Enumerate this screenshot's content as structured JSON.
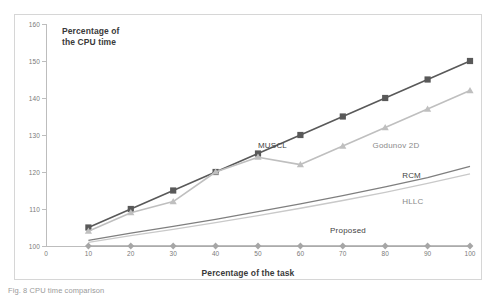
{
  "figure": {
    "caption": "Fig. 8 CPU time comparison"
  },
  "chart_data": {
    "type": "line",
    "title": "",
    "axis_title_y": "Percentage of\nthe CPU time",
    "axis_title_y_line1": "Percentage of",
    "axis_title_y_line2": "the CPU time",
    "xlabel": "Percentage of the task",
    "ylabel": "Percentage of the CPU time",
    "x": [
      10,
      20,
      30,
      40,
      50,
      60,
      70,
      80,
      90,
      100
    ],
    "xticks": [
      0,
      10,
      20,
      30,
      40,
      50,
      60,
      70,
      80,
      90,
      100
    ],
    "yticks": [
      100,
      110,
      120,
      130,
      140,
      150,
      160
    ],
    "y_axis_origin_label": "0",
    "xlim": [
      0,
      100
    ],
    "ylim": [
      100,
      160
    ],
    "grid": false,
    "legend_position": "inline-annotations",
    "series": [
      {
        "name": "MUSCL",
        "color": "#595959",
        "marker": "square",
        "values": [
          105,
          110,
          115,
          120,
          125,
          130,
          135,
          140,
          145,
          150
        ],
        "label_x": 50,
        "label_y": 127
      },
      {
        "name": "Godunov 2D",
        "color": "#bfbfbf",
        "marker": "triangle",
        "values": [
          104,
          109,
          112,
          120,
          124,
          122,
          127,
          132,
          137,
          142
        ],
        "label_x": 77,
        "label_y": 127
      },
      {
        "name": "RCM",
        "color": "#7f7f7f",
        "marker": "none",
        "values": [
          101.5,
          103.5,
          105.3,
          107.2,
          109.3,
          111.4,
          113.6,
          116,
          118.5,
          121.5
        ],
        "label_x": 84,
        "label_y": 119
      },
      {
        "name": "HLLC",
        "color": "#c9c9c9",
        "marker": "none",
        "values": [
          101,
          102.8,
          104.5,
          106.3,
          108.2,
          110.2,
          112.3,
          114.5,
          116.9,
          119.5
        ],
        "label_x": 84,
        "label_y": 112
      },
      {
        "name": "Proposed",
        "color": "#a6a6a6",
        "marker": "diamond",
        "values": [
          100,
          100,
          100,
          100,
          100,
          100,
          100,
          100,
          100,
          100
        ],
        "label_x": 67,
        "label_y": 104
      }
    ]
  }
}
